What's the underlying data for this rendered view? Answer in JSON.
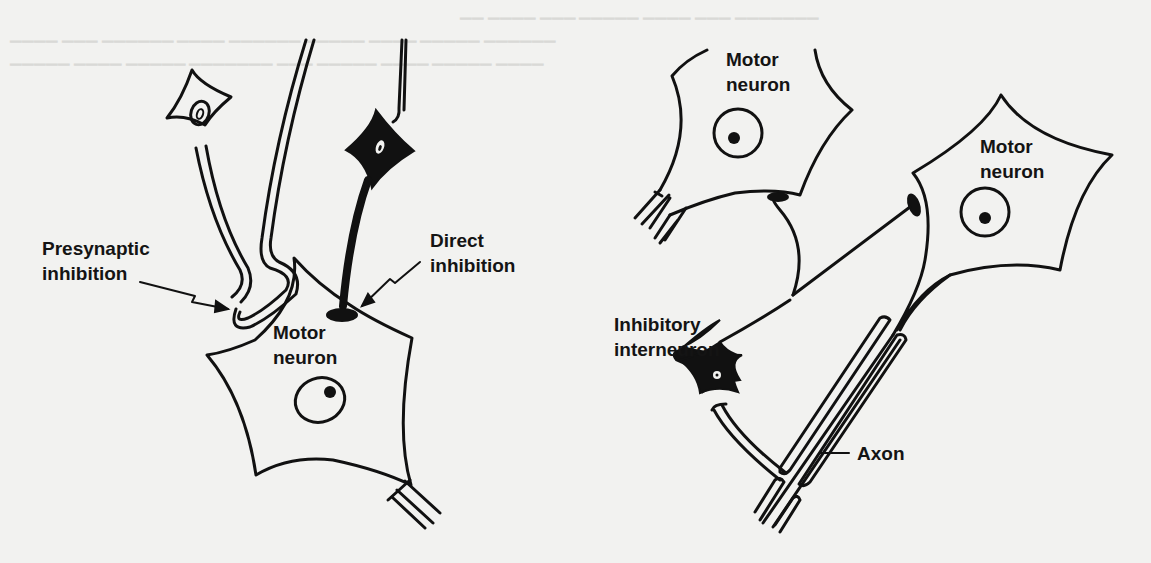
{
  "figure": {
    "left_panel": {
      "labels": {
        "presynaptic_line1": "Presynaptic",
        "presynaptic_line2": "inhibition",
        "direct_line1": "Direct",
        "direct_line2": "inhibition",
        "motor_line1": "Motor",
        "motor_line2": "neuron"
      }
    },
    "right_panel": {
      "labels": {
        "motor_top_line1": "Motor",
        "motor_top_line2": "neuron",
        "motor_right_line1": "Motor",
        "motor_right_line2": "neuron",
        "interneuron_line1": "Inhibitory",
        "interneuron_line2": "interneuron",
        "axon": "Axon"
      }
    },
    "colors": {
      "ink": "#111111",
      "paper": "#f2f2f0",
      "bleed_text": "#d9d9d6"
    }
  }
}
